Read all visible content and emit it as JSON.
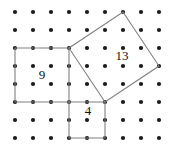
{
  "figure": {
    "width": 179,
    "height": 148,
    "background_color": "#ffffff"
  },
  "lattice": {
    "name": "dot-grid",
    "columns": 9,
    "rows": 8,
    "spacing": 18,
    "origin_x": 15,
    "origin_y": 12,
    "dot_radius": 2.1,
    "dot_color": "#1a1a1a",
    "x_positions": [
      15,
      33,
      51,
      69,
      87,
      105,
      123,
      141,
      159
    ],
    "y_positions": [
      12,
      30,
      48,
      66,
      84,
      102,
      120,
      138
    ]
  },
  "style": {
    "stroke_color": "#808080",
    "stroke_width": 1.1,
    "label_color": "#111111",
    "label_font_size": 13
  },
  "shapes": [
    {
      "id": "square-9",
      "name": "left-square",
      "label": "9",
      "label_x": 42,
      "label_y": 76,
      "points": "15,48 69,48 69,102 15,102",
      "vertices": [
        [
          15,
          48
        ],
        [
          69,
          48
        ],
        [
          69,
          102
        ],
        [
          15,
          102
        ]
      ],
      "side_units": 3,
      "area_units": 9,
      "orientation": "axis-aligned"
    },
    {
      "id": "square-13",
      "name": "tilted-square",
      "label": "13",
      "label_x": 122,
      "label_y": 57,
      "points": "69,48 123,12 159,66 105,102",
      "vertices": [
        [
          69,
          48
        ],
        [
          123,
          12
        ],
        [
          159,
          66
        ],
        [
          105,
          102
        ]
      ],
      "side_units": 3.606,
      "area_units": 13,
      "orientation": "tilted"
    },
    {
      "id": "square-4",
      "name": "bottom-square",
      "label": "4",
      "label_x": 88,
      "label_y": 112,
      "points": "69,102 105,102 105,138 69,138",
      "vertices": [
        [
          69,
          102
        ],
        [
          105,
          102
        ],
        [
          105,
          138
        ],
        [
          69,
          138
        ]
      ],
      "side_units": 2,
      "area_units": 4,
      "orientation": "axis-aligned"
    }
  ],
  "labels": [
    {
      "text": "9",
      "x": 42,
      "y": 76
    },
    {
      "text": "13",
      "x": 122,
      "y": 57
    },
    {
      "text": "4",
      "x": 88,
      "y": 112
    }
  ]
}
